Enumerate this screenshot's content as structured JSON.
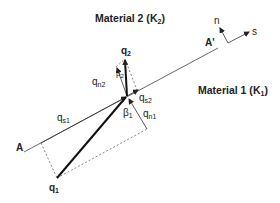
{
  "materials": {
    "top": {
      "name": "Material 2",
      "k": "K",
      "k_sub": "2"
    },
    "bottom": {
      "name": "Material 1",
      "k": "K",
      "k_sub": "1"
    }
  },
  "interface": {
    "start_label": "A",
    "end_label": "A'"
  },
  "axes": {
    "normal": "n",
    "tangent": "s"
  },
  "vectors": {
    "q1": {
      "base": "q",
      "sub": "1"
    },
    "q2": {
      "base": "q",
      "sub": "2"
    },
    "qs1": {
      "base": "q",
      "sub": "s1"
    },
    "qn1": {
      "base": "q",
      "sub": "n1"
    },
    "qs2": {
      "base": "q",
      "sub": "s2"
    },
    "qn2": {
      "base": "q",
      "sub": "n2"
    }
  },
  "angles": {
    "beta1": {
      "base": "β",
      "sub": "1"
    },
    "beta2": {
      "base": "β",
      "sub": "2"
    }
  },
  "colors": {
    "line": "#333333",
    "bold_vector": "#111111",
    "dashed": "#555555"
  }
}
